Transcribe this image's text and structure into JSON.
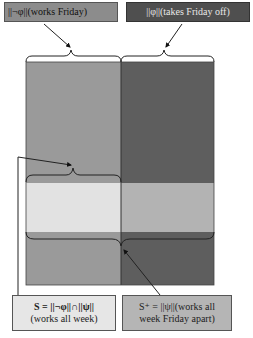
{
  "labels": {
    "not_phi": "||¬φ||(works Friday)",
    "phi": "||φ||(takes Friday off)",
    "s_line1": "S = ||¬φ||∩||ψ||",
    "s_line2": "(works all week)",
    "splus_line1": "S⁺ = ||ψ||(works all",
    "splus_line2": "week Friday apart)"
  },
  "colors": {
    "not_phi_box": "#8c8c8c",
    "phi_box": "#4f4f4f",
    "left_region": "#9a9a9a",
    "right_region": "#5e5e5e",
    "left_band": "#e2e2e2",
    "right_band": "#b3b3b3",
    "s_box": "#e6e6e6",
    "splus_box": "#b5b5b5"
  }
}
